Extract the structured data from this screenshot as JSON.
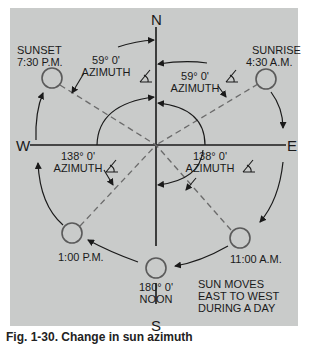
{
  "figure": {
    "background_color": "#c9cbca",
    "line_color": "#1a1a1a",
    "dashed_line_color": "#6b6b6b"
  },
  "compass": {
    "north": "N",
    "south": "S",
    "east": "E",
    "west": "W"
  },
  "sun_positions": [
    {
      "id": "sunrise",
      "label_line1": "SUNRISE",
      "label_line2": "4:30 A.M."
    },
    {
      "id": "sunset",
      "label_line1": "SUNSET",
      "label_line2": "7:30 P.M."
    },
    {
      "id": "eleven-am",
      "label_line1": "11:00 A.M."
    },
    {
      "id": "one-pm",
      "label_line1": "1:00 P.M."
    },
    {
      "id": "noon",
      "label_line1": "180° 0'",
      "label_line2": "NOON"
    }
  ],
  "azimuths": [
    {
      "id": "sunset-azimuth",
      "value": "59° 0'",
      "label": "AZIMUTH"
    },
    {
      "id": "sunrise-azimuth",
      "value": "59° 0'",
      "label": "AZIMUTH"
    },
    {
      "id": "one-pm-azimuth",
      "value": "138° 0'",
      "label": "AZIMUTH"
    },
    {
      "id": "eleven-am-azimuth",
      "value": "138° 0'",
      "label": "AZIMUTH"
    }
  ],
  "note": {
    "line1": "SUN MOVES",
    "line2": "EAST TO WEST",
    "line3": "DURING A DAY"
  },
  "caption": "Fig. 1-30.  Change in sun azimuth"
}
